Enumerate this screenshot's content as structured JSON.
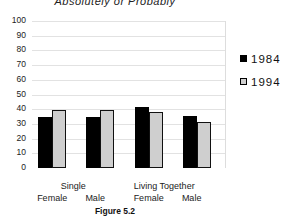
{
  "chart_data": {
    "type": "bar",
    "title": "Absolutely or Probably",
    "caption": "Figure 5.2",
    "xlabel": "",
    "ylabel": "",
    "ylim": [
      0,
      100
    ],
    "yticks": [
      0,
      10,
      20,
      30,
      40,
      50,
      60,
      70,
      80,
      90,
      100
    ],
    "grid": true,
    "legend_position": "right",
    "group_labels": [
      {
        "label": "Single",
        "spans": [
          0,
          1
        ]
      },
      {
        "label": "Living Together",
        "spans": [
          2,
          3
        ]
      }
    ],
    "categories": [
      "Female",
      "Male",
      "Female",
      "Male"
    ],
    "series": [
      {
        "name": "1984",
        "color": "#000000",
        "values": [
          34.5,
          35,
          41.5,
          35.5
        ]
      },
      {
        "name": "1994",
        "color": "#cfcfcf",
        "values": [
          39.5,
          39.5,
          38,
          31.5
        ]
      }
    ]
  }
}
